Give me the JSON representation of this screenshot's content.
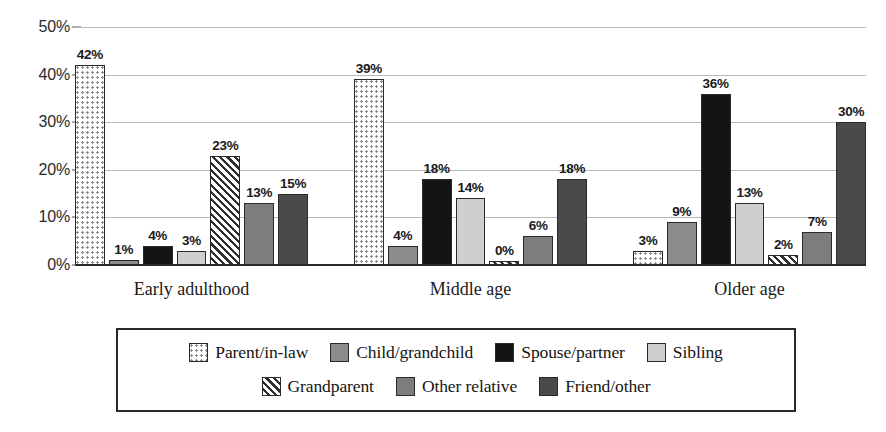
{
  "chart_data": {
    "type": "bar",
    "title": "",
    "subtitle": "",
    "xlabel": "",
    "ylabel": "",
    "ylim": [
      0,
      50
    ],
    "grid": true,
    "legend_position": "bottom",
    "y_ticks": [
      "0%",
      "10%",
      "20%",
      "30%",
      "40%",
      "50%"
    ],
    "y_tick_values": [
      0,
      10,
      20,
      30,
      40,
      50
    ],
    "categories": [
      "Early adulthood",
      "Middle age",
      "Older age"
    ],
    "series": [
      {
        "name": "Parent/in-law",
        "pattern": "dotted",
        "values": [
          42,
          39,
          3
        ]
      },
      {
        "name": "Child/grandchild",
        "pattern": "mid-gray",
        "values": [
          1,
          4,
          9
        ]
      },
      {
        "name": "Spouse/partner",
        "pattern": "black",
        "values": [
          4,
          18,
          36
        ]
      },
      {
        "name": "Sibling",
        "pattern": "light-gray",
        "values": [
          3,
          14,
          13
        ]
      },
      {
        "name": "Grandparent",
        "pattern": "hatched",
        "values": [
          23,
          0,
          2
        ]
      },
      {
        "name": "Other relative",
        "pattern": "gray",
        "values": [
          13,
          6,
          7
        ]
      },
      {
        "name": "Friend/other",
        "pattern": "dark-gray",
        "values": [
          15,
          18,
          30
        ]
      }
    ],
    "data_labels": [
      [
        "42%",
        "1%",
        "4%",
        "3%",
        "23%",
        "13%",
        "15%"
      ],
      [
        "39%",
        "4%",
        "18%",
        "14%",
        "0%",
        "6%",
        "18%"
      ],
      [
        "3%",
        "9%",
        "36%",
        "13%",
        "2%",
        "7%",
        "30%"
      ]
    ],
    "colors": {
      "parent_in_law": "#ffffff",
      "child_grandchild": "#8b8b8b",
      "spouse_partner": "#141414",
      "sibling": "#cfcfcf",
      "grandparent": "#ffffff",
      "other_relative": "#7d7d7d",
      "friend_other": "#4a4a4a",
      "axis": "#2a2a2a",
      "gridline": "#b8b8b8"
    }
  },
  "legend": {
    "row1": [
      {
        "label": "Parent/in-law",
        "key": "parent"
      },
      {
        "label": "Child/grandchild",
        "key": "child"
      },
      {
        "label": "Spouse/partner",
        "key": "spouse"
      },
      {
        "label": "Sibling",
        "key": "sibling"
      }
    ],
    "row2": [
      {
        "label": "Grandparent",
        "key": "grandparent"
      },
      {
        "label": "Other relative",
        "key": "otherrel"
      },
      {
        "label": "Friend/other",
        "key": "friend"
      }
    ]
  }
}
